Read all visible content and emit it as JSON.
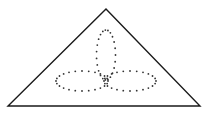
{
  "figure": {
    "width": 204,
    "height": 122,
    "background": "#ffffff",
    "stroke_color": "#1a1a1a",
    "dot_color": "#333333",
    "triangle": {
      "points": [
        [
          106,
          9
        ],
        [
          8,
          106
        ],
        [
          200,
          106
        ]
      ],
      "stroke_width": 1.4
    },
    "trefoil": {
      "petals": [
        {
          "name": "top",
          "cx": 106,
          "cy": 55,
          "rx": 9.5,
          "ry": 25,
          "rotate": 0
        },
        {
          "name": "left",
          "cx": 82,
          "cy": 81,
          "rx": 26,
          "ry": 10,
          "rotate": 0
        },
        {
          "name": "right",
          "cx": 130,
          "cy": 81,
          "rx": 26,
          "ry": 10,
          "rotate": 0
        }
      ],
      "dot_radius": 0.9,
      "dot_spacing": 5
    }
  }
}
